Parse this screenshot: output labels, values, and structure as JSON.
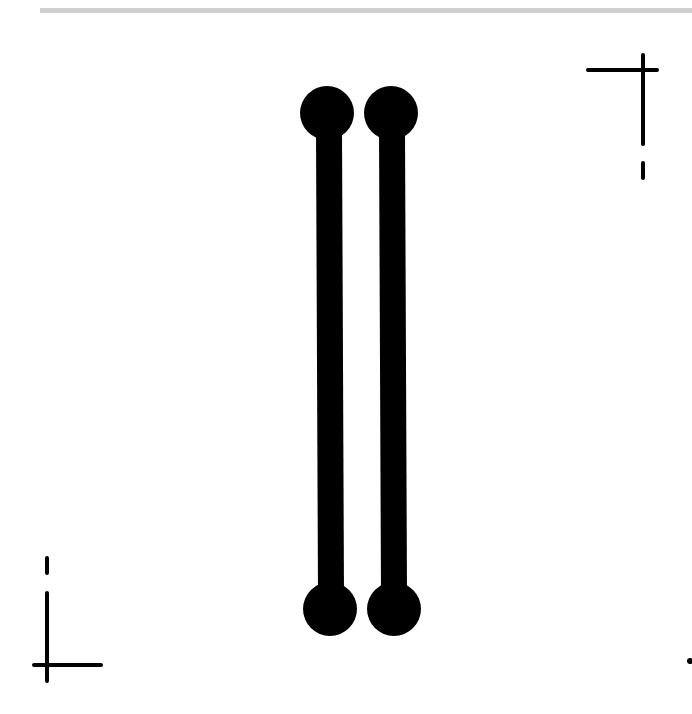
{
  "canvas": {
    "width": 692,
    "height": 714,
    "background": "#ffffff",
    "ink_color": "#000000",
    "rule_color": "#cfcfcf"
  },
  "top_rule": {
    "x": 40,
    "y": 8,
    "width": 652,
    "height": 5
  },
  "bars": [
    {
      "name": "left-dumbbell",
      "top_cap": {
        "cx": 327,
        "cy": 113,
        "r": 27
      },
      "shaft": {
        "x1": 329,
        "y1": 130,
        "x2": 331,
        "y2": 595,
        "width": 26
      },
      "bottom_cap": {
        "cx": 330,
        "cy": 609,
        "r": 27
      }
    },
    {
      "name": "right-dumbbell",
      "top_cap": {
        "cx": 391,
        "cy": 113,
        "r": 27
      },
      "shaft": {
        "x1": 392,
        "y1": 130,
        "x2": 394,
        "y2": 595,
        "width": 26
      },
      "bottom_cap": {
        "cx": 394,
        "cy": 609,
        "r": 27
      }
    }
  ],
  "crop_marks": {
    "top_right": {
      "horizontal": {
        "x1": 588,
        "y1": 70,
        "x2": 657,
        "y2": 70
      },
      "vertical": {
        "x1": 643,
        "y1": 55,
        "x2": 643,
        "y2": 144
      },
      "dash": {
        "x1": 643,
        "y1": 163,
        "x2": 643,
        "y2": 178
      }
    },
    "bottom_left": {
      "dash": {
        "x1": 47,
        "y1": 558,
        "x2": 47,
        "y2": 573
      },
      "vertical": {
        "x1": 47,
        "y1": 593,
        "x2": 47,
        "y2": 681
      },
      "horizontal": {
        "x1": 34,
        "y1": 665,
        "x2": 101,
        "y2": 665
      }
    },
    "edge_dot": {
      "cx": 690,
      "cy": 661,
      "r": 3
    }
  }
}
